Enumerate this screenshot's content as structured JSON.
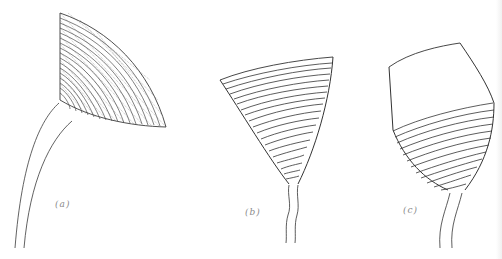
{
  "figure": {
    "panels": [
      {
        "id": "a",
        "label": "(a)",
        "description": "fan-shaped cup with dense concentric rings and radial striations on curved stalk"
      },
      {
        "id": "b",
        "label": "(b)",
        "description": "inverted cone with ~20 horizontal rings on thin wavy stalk"
      },
      {
        "id": "c",
        "label": "(c)",
        "description": "goblet-shaped cup, smooth upper portion, ringed lower portion on stalk"
      }
    ],
    "colors": {
      "line": "#333333",
      "background": "#ffffff",
      "label": "#8a8a8a"
    }
  }
}
